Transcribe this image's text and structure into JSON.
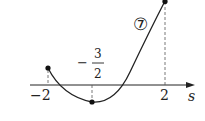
{
  "diagram": {
    "type": "function-graph",
    "curve_label": "⑦",
    "axis": {
      "variable": "s",
      "ticks": [
        {
          "value": -2,
          "label": "−2"
        },
        {
          "value": -1.5,
          "label_minus": "−",
          "label_num": "3",
          "label_den": "2"
        },
        {
          "value": 2,
          "label": "2"
        }
      ]
    },
    "points": [
      {
        "name": "left-endpoint",
        "s": -2
      },
      {
        "name": "vertex-minimum",
        "s": -1.5
      },
      {
        "name": "right-endpoint",
        "s": 2
      }
    ],
    "colors": {
      "stroke": "#222222",
      "dashed": "#555555"
    }
  }
}
